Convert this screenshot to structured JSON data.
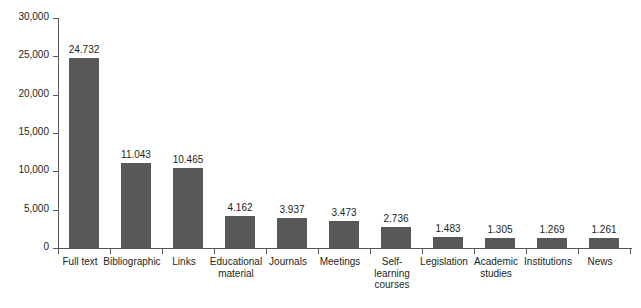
{
  "chart_data": {
    "type": "bar",
    "title": "",
    "subtitle": "",
    "xlabel": "",
    "ylabel": "",
    "ylim": [
      0,
      30000
    ],
    "grid": false,
    "legend": null,
    "orientation": "vertical",
    "bar_color": "#58585a",
    "axis_color": "#58585a",
    "text_color": "#231f20",
    "background": "#ffffff",
    "y_ticks": [
      0,
      5000,
      10000,
      15000,
      20000,
      25000,
      30000
    ],
    "y_tick_labels": [
      "0",
      "5,000",
      "10,000",
      "15,000",
      "20,000",
      "25,000",
      "30,000"
    ],
    "categories": [
      "Full text",
      "Bibliographic",
      "Links",
      "Educational material",
      "Journals",
      "Meetings",
      "Self-learning courses",
      "Legislation",
      "Academic studies",
      "Institutions",
      "News"
    ],
    "category_labels": [
      [
        "Full text"
      ],
      [
        "Bibliographic"
      ],
      [
        "Links"
      ],
      [
        "Educational",
        "material"
      ],
      [
        "Journals"
      ],
      [
        "Meetings"
      ],
      [
        "Self-",
        "learning",
        "courses"
      ],
      [
        "Legislation"
      ],
      [
        "Academic",
        "studies"
      ],
      [
        "Institutions"
      ],
      [
        "News"
      ]
    ],
    "values": [
      24732,
      11043,
      10465,
      4162,
      3937,
      3473,
      2736,
      1483,
      1305,
      1269,
      1261
    ],
    "value_labels": [
      "24.732",
      "11.043",
      "10.465",
      "4.162",
      "3.937",
      "3.473",
      "2.736",
      "1.483",
      "1.305",
      "1.269",
      "1.261"
    ]
  }
}
